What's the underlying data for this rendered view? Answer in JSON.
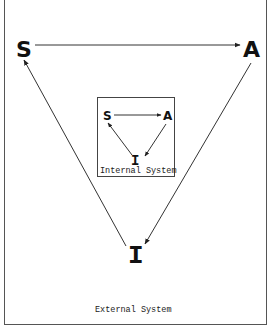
{
  "diagram": {
    "external": {
      "nodes": {
        "s": "S",
        "a": "A",
        "i": "I"
      },
      "label": "External System"
    },
    "internal": {
      "nodes": {
        "s": "S",
        "a": "A",
        "i": "I"
      },
      "label": "Internal System"
    },
    "edges": [
      {
        "from": "S",
        "to": "A"
      },
      {
        "from": "A",
        "to": "I"
      },
      {
        "from": "I",
        "to": "S"
      }
    ],
    "colors": {
      "stroke": "#333333",
      "text": "#111111",
      "background": "#ffffff"
    }
  }
}
